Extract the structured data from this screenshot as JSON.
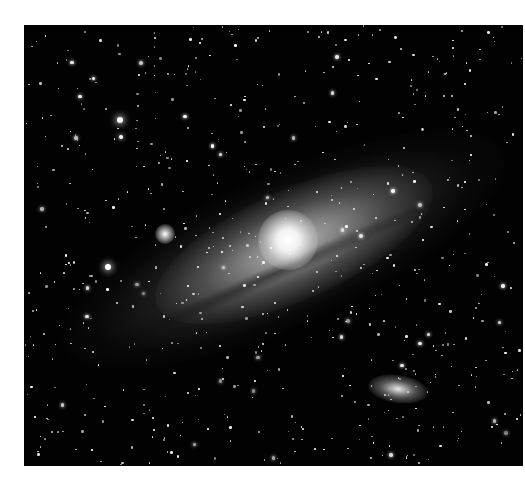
{
  "image": {
    "subject": "Andromeda galaxy (spiral galaxy with two companion galaxies) in a dense star field",
    "style": "monochrome astrophotograph",
    "colors": {
      "background": "#020202",
      "page": "#ffffff",
      "core": "#ffffff"
    }
  },
  "features": [
    {
      "name": "galaxy-core",
      "x": 288,
      "y": 240
    },
    {
      "name": "companion-galaxy-m32",
      "x": 165,
      "y": 233
    },
    {
      "name": "companion-galaxy-m110",
      "x": 398,
      "y": 388
    },
    {
      "name": "bright-star-upper-left",
      "x": 120,
      "y": 120
    },
    {
      "name": "bright-star-left",
      "x": 108,
      "y": 267
    }
  ]
}
